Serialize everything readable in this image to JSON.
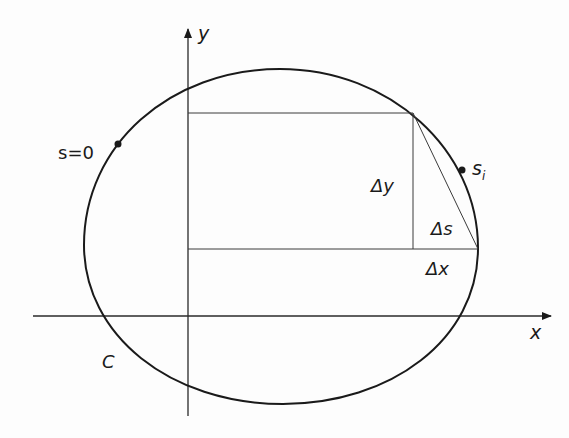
{
  "diagram": {
    "type": "arc-length-construction",
    "curve": {
      "label": "C",
      "shape": "closed-oval",
      "center": [
        281,
        237
      ],
      "rx": 197,
      "ry": 168
    },
    "axes": {
      "x_label": "x",
      "y_label": "y"
    },
    "points": {
      "start_label": "s=0",
      "current_label_base": "s",
      "current_label_sub": "i"
    },
    "increments": {
      "dx_label": "Δx",
      "dy_label": "Δy",
      "ds_label": "Δs"
    },
    "colors": {
      "stroke": "#1a1a1a",
      "thin_stroke": "#3a3a3a",
      "background": "#fdfdfd"
    }
  }
}
